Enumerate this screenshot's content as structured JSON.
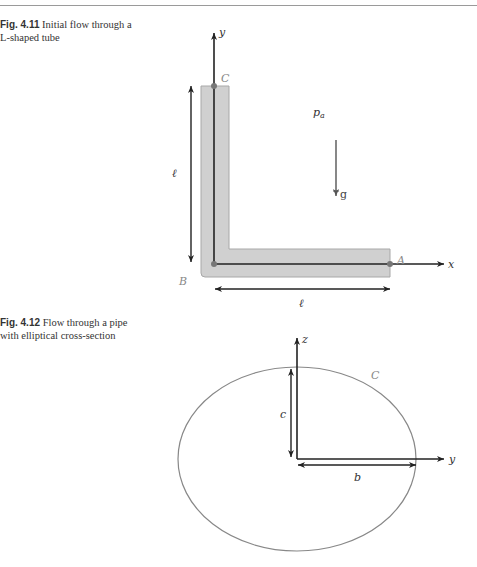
{
  "figures": [
    {
      "number": "Fig. 4.11",
      "caption": "Initial flow through a L-shaped tube",
      "labels": {
        "y_axis": "y",
        "x_axis": "x",
        "point_c": "C",
        "point_b": "B",
        "point_a": "A",
        "pressure": "p",
        "pressure_sub": "a",
        "gravity": "g",
        "length_vertical": "ℓ",
        "length_horizontal": "ℓ"
      },
      "colors": {
        "tube_fill": "#d0d0d0",
        "tube_edge": "#a8a8a8",
        "axes": "#222222",
        "points": "#777777"
      }
    },
    {
      "number": "Fig. 4.12",
      "caption": "Flow through a pipe with elliptical cross-section",
      "labels": {
        "z_axis": "z",
        "y_axis": "y",
        "curve": "C",
        "semi_axis_vertical": "c",
        "semi_axis_horizontal": "b"
      },
      "colors": {
        "ellipse": "#888888",
        "axes": "#222222"
      }
    }
  ]
}
